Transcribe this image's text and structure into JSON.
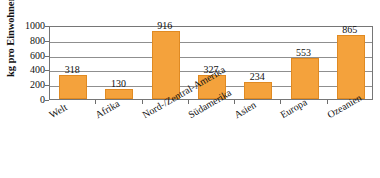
{
  "chart_data": {
    "type": "bar",
    "title": "",
    "subtitle": "",
    "xlabel": "",
    "ylabel": "kg pro Einwohner",
    "ylim": [
      0,
      1000
    ],
    "yticks": [
      0,
      200,
      400,
      600,
      800,
      1000
    ],
    "ytick_labels": [
      "0",
      "200",
      "400",
      "600",
      "800",
      "1000"
    ],
    "grid": true,
    "legend": null,
    "legend_position": "none",
    "categories": [
      "Welt",
      "Afrika",
      "Nord-/Zentral-Amerika",
      "Südamerika",
      "Asien",
      "Europa",
      "Ozeanien"
    ],
    "values": [
      318,
      130,
      916,
      327,
      234,
      553,
      865
    ],
    "value_labels": [
      "318",
      "130",
      "916",
      "327",
      "234",
      "553",
      "865"
    ],
    "bar_color": "#F4A23C",
    "bar_border_color": "#E08A22",
    "gridline_color": "#8F8F8F",
    "axis_color": "#767676",
    "background_color": "#FFFFFF"
  }
}
